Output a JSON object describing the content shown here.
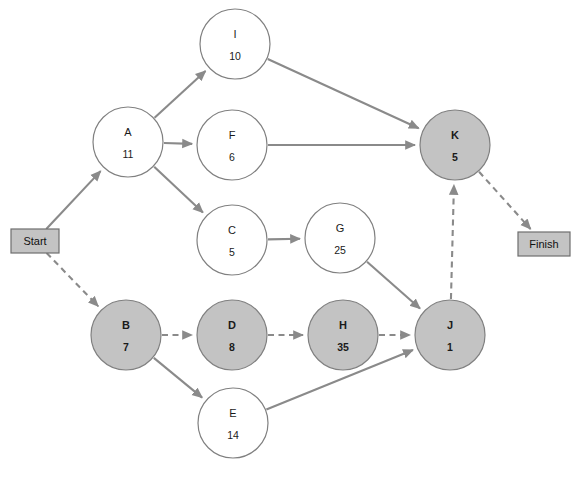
{
  "diagram": {
    "type": "activity-on-node-network",
    "canvas": {
      "width": 576,
      "height": 485
    },
    "colors": {
      "background": "#ffffff",
      "node_fill_plain": "#ffffff",
      "node_fill_shaded": "#c3c3c3",
      "node_stroke": "#808080",
      "edge": "#8a8a8a",
      "terminal_fill": "#c3c3c3",
      "terminal_stroke": "#6e6e6e",
      "text": "#1a1a1a"
    },
    "terminals": [
      {
        "id": "Start",
        "label": "Start",
        "x": 11,
        "y": 229,
        "w": 48,
        "h": 24
      },
      {
        "id": "Finish",
        "label": "Finish",
        "x": 518,
        "y": 232,
        "w": 52,
        "h": 24
      }
    ],
    "nodes": [
      {
        "id": "I",
        "label": "I",
        "duration": "10",
        "cx": 235,
        "cy": 44,
        "r": 35,
        "shaded": false
      },
      {
        "id": "A",
        "label": "A",
        "duration": "11",
        "cx": 128,
        "cy": 142,
        "r": 35,
        "shaded": false
      },
      {
        "id": "F",
        "label": "F",
        "duration": "6",
        "cx": 232,
        "cy": 145,
        "r": 35,
        "shaded": false
      },
      {
        "id": "K",
        "label": "K",
        "duration": "5",
        "cx": 455,
        "cy": 145,
        "r": 35,
        "shaded": true
      },
      {
        "id": "C",
        "label": "C",
        "duration": "5",
        "cx": 232,
        "cy": 240,
        "r": 35,
        "shaded": false
      },
      {
        "id": "G",
        "label": "G",
        "duration": "25",
        "cx": 340,
        "cy": 238,
        "r": 35,
        "shaded": false
      },
      {
        "id": "B",
        "label": "B",
        "duration": "7",
        "cx": 126,
        "cy": 335,
        "r": 35,
        "shaded": true
      },
      {
        "id": "D",
        "label": "D",
        "duration": "8",
        "cx": 232,
        "cy": 335,
        "r": 35,
        "shaded": true
      },
      {
        "id": "H",
        "label": "H",
        "duration": "35",
        "cx": 343,
        "cy": 335,
        "r": 35,
        "shaded": true
      },
      {
        "id": "J",
        "label": "J",
        "duration": "1",
        "cx": 450,
        "cy": 335,
        "r": 35,
        "shaded": true
      },
      {
        "id": "E",
        "label": "E",
        "duration": "14",
        "cx": 233,
        "cy": 423,
        "r": 35,
        "shaded": false
      }
    ],
    "edges": [
      {
        "from": "Start",
        "to": "A",
        "style": "solid"
      },
      {
        "from": "Start",
        "to": "B",
        "style": "dashed"
      },
      {
        "from": "A",
        "to": "I",
        "style": "solid"
      },
      {
        "from": "A",
        "to": "F",
        "style": "solid"
      },
      {
        "from": "A",
        "to": "C",
        "style": "solid"
      },
      {
        "from": "I",
        "to": "K",
        "style": "solid"
      },
      {
        "from": "F",
        "to": "K",
        "style": "solid"
      },
      {
        "from": "C",
        "to": "G",
        "style": "solid"
      },
      {
        "from": "G",
        "to": "J",
        "style": "solid"
      },
      {
        "from": "B",
        "to": "D",
        "style": "dashed"
      },
      {
        "from": "B",
        "to": "E",
        "style": "solid"
      },
      {
        "from": "D",
        "to": "H",
        "style": "dashed"
      },
      {
        "from": "H",
        "to": "J",
        "style": "dashed"
      },
      {
        "from": "E",
        "to": "J",
        "style": "solid"
      },
      {
        "from": "J",
        "to": "K",
        "style": "dashed"
      },
      {
        "from": "K",
        "to": "Finish",
        "style": "dashed"
      }
    ]
  }
}
